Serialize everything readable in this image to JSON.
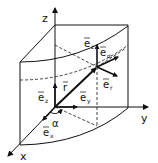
{
  "diagram": {
    "axes": {
      "x": "x",
      "y": "y",
      "z": "z"
    },
    "vectors": {
      "r": "r",
      "e_x": {
        "base": "e",
        "sub": "x"
      },
      "e_y": {
        "base": "e",
        "sub": "y"
      },
      "e_z": {
        "base": "e",
        "sub": "z"
      },
      "e_z_at_point": {
        "base": "e",
        "sub": "z"
      },
      "e_alpha": {
        "base": "e",
        "sub": "α"
      },
      "e_r": {
        "base": "e",
        "sub": "r"
      }
    },
    "angle": "α",
    "colors": {
      "stroke": "#111111",
      "background": "#ffffff"
    }
  }
}
